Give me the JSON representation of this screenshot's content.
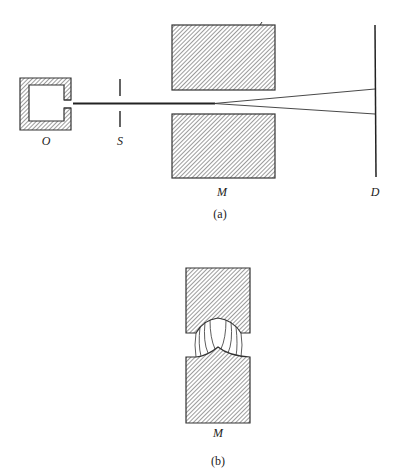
{
  "figure_a": {
    "caption": "(a)",
    "labels": {
      "source": "O",
      "slit": "S",
      "magnet": "M",
      "detector": "D"
    }
  },
  "figure_b": {
    "caption": "(b)",
    "labels": {
      "magnet": "M"
    }
  },
  "colors": {
    "stroke": "#333333",
    "hatch": "#555555",
    "background": "#ffffff"
  }
}
